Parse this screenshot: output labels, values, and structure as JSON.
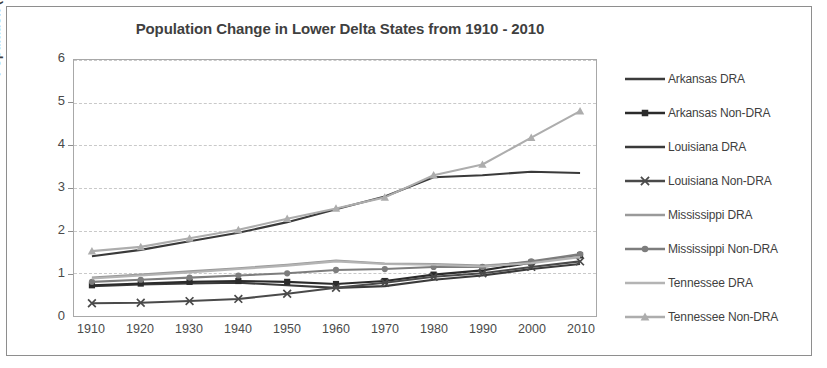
{
  "chart_data": {
    "type": "line",
    "title": "Population Change in Lower Delta States from 1910 - 2010",
    "xlabel": "",
    "ylabel": "Population (Millions)",
    "ylim": [
      0,
      6
    ],
    "ytick_labels": [
      "0",
      "1",
      "2",
      "3",
      "4",
      "5",
      "6"
    ],
    "ytick_values": [
      0,
      1,
      2,
      3,
      4,
      5,
      6
    ],
    "grid": true,
    "legend_position": "right",
    "categories": [
      1910,
      1920,
      1930,
      1940,
      1950,
      1960,
      1970,
      1980,
      1990,
      2000,
      2010
    ],
    "xtick_labels": [
      "1910",
      "1920",
      "1930",
      "1940",
      "1950",
      "1960",
      "1970",
      "1980",
      "1990",
      "2000",
      "2010"
    ],
    "series": [
      {
        "name": "Arkansas DRA",
        "color": "#3b3b3b",
        "marker": "none",
        "values": [
          0.7,
          0.74,
          0.76,
          0.78,
          0.72,
          0.66,
          0.7,
          0.85,
          0.95,
          1.1,
          1.22
        ]
      },
      {
        "name": "Arkansas Non-DRA",
        "color": "#2b2b2b",
        "marker": "square",
        "values": [
          0.72,
          0.76,
          0.8,
          0.82,
          0.8,
          0.75,
          0.82,
          0.97,
          1.07,
          1.25,
          1.42
        ]
      },
      {
        "name": "Louisiana DRA",
        "color": "#3a3a3a",
        "marker": "none",
        "values": [
          1.4,
          1.55,
          1.75,
          1.95,
          2.2,
          2.5,
          2.8,
          3.25,
          3.3,
          3.38,
          3.35
        ]
      },
      {
        "name": "Louisiana Non-DRA",
        "color": "#4a4a4a",
        "marker": "x",
        "values": [
          0.3,
          0.31,
          0.35,
          0.4,
          0.52,
          0.66,
          0.78,
          0.92,
          1.0,
          1.15,
          1.28
        ]
      },
      {
        "name": "Mississippi DRA",
        "color": "#9a9a9a",
        "marker": "none",
        "values": [
          0.9,
          0.97,
          1.05,
          1.12,
          1.2,
          1.3,
          1.23,
          1.22,
          1.18,
          1.26,
          1.4
        ]
      },
      {
        "name": "Mississippi Non-DRA",
        "color": "#7d7d7d",
        "marker": "circle",
        "values": [
          0.8,
          0.85,
          0.9,
          0.95,
          1.0,
          1.08,
          1.1,
          1.15,
          1.15,
          1.28,
          1.45
        ]
      },
      {
        "name": "Tennessee DRA",
        "color": "#b4b4b4",
        "marker": "none",
        "values": [
          0.88,
          0.95,
          1.02,
          1.1,
          1.18,
          1.28,
          1.22,
          1.2,
          1.16,
          1.24,
          1.38
        ]
      },
      {
        "name": "Tennessee Non-DRA",
        "color": "#adadad",
        "marker": "triangle",
        "values": [
          1.52,
          1.62,
          1.82,
          2.02,
          2.28,
          2.52,
          2.78,
          3.3,
          3.55,
          4.18,
          4.8
        ]
      }
    ]
  },
  "legend": {
    "items": [
      {
        "label": "Arkansas DRA"
      },
      {
        "label": "Arkansas Non-DRA"
      },
      {
        "label": "Louisiana DRA"
      },
      {
        "label": "Louisiana Non-DRA"
      },
      {
        "label": "Mississippi DRA"
      },
      {
        "label": "Mississippi Non-DRA"
      },
      {
        "label": "Tennessee DRA"
      },
      {
        "label": "Tennessee Non-DRA"
      }
    ]
  }
}
